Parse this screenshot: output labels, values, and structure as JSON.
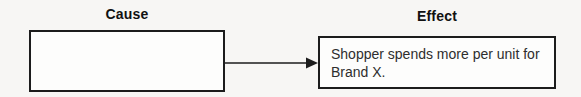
{
  "diagram": {
    "cause": {
      "label": "Cause",
      "box_text": ""
    },
    "effect": {
      "label": "Effect",
      "box_text": "Shopper spends more per unit for Brand X."
    },
    "connector": {
      "type": "arrow",
      "direction": "right",
      "from": "cause-box",
      "to": "effect-box"
    },
    "colors": {
      "background": "#f7f6f4",
      "box_fill": "#fdfdfc",
      "box_border": "#1c1c1c",
      "label_text": "#111111",
      "body_text": "#2e2e2e",
      "arrow": "#1c1c1c"
    }
  }
}
